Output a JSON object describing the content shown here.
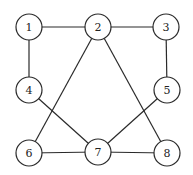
{
  "diagram": {
    "type": "graph",
    "node_radius": 13,
    "nodes": [
      {
        "id": "1",
        "label": "1",
        "x": 29,
        "y": 27
      },
      {
        "id": "2",
        "label": "2",
        "x": 98,
        "y": 27
      },
      {
        "id": "3",
        "label": "3",
        "x": 166,
        "y": 27
      },
      {
        "id": "4",
        "label": "4",
        "x": 29,
        "y": 90
      },
      {
        "id": "5",
        "label": "5",
        "x": 167,
        "y": 90
      },
      {
        "id": "6",
        "label": "6",
        "x": 29,
        "y": 153
      },
      {
        "id": "7",
        "label": "7",
        "x": 98,
        "y": 152
      },
      {
        "id": "8",
        "label": "8",
        "x": 167,
        "y": 153
      }
    ],
    "edges": [
      {
        "from": "1",
        "to": "2"
      },
      {
        "from": "2",
        "to": "3"
      },
      {
        "from": "1",
        "to": "4"
      },
      {
        "from": "3",
        "to": "5"
      },
      {
        "from": "2",
        "to": "6"
      },
      {
        "from": "2",
        "to": "8"
      },
      {
        "from": "4",
        "to": "7"
      },
      {
        "from": "5",
        "to": "7"
      },
      {
        "from": "6",
        "to": "7"
      },
      {
        "from": "7",
        "to": "8"
      }
    ],
    "colors": {
      "stroke": "#2a2a2a",
      "fill": "#ffffff",
      "text": "#222222"
    }
  }
}
